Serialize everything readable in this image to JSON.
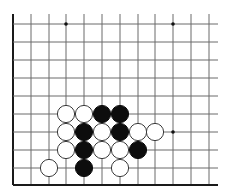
{
  "board": {
    "grid_color": "#6a6a6a",
    "edge_color": "#1a1a1a",
    "background": "#ffffff",
    "x_lines": [
      13,
      31,
      49,
      66,
      84,
      102,
      120,
      138,
      155,
      173,
      191,
      209
    ],
    "y_lines": [
      24,
      42,
      60,
      78,
      96,
      114,
      132,
      150,
      168,
      185
    ],
    "left_edge": true,
    "bottom_edge": true,
    "line_top_extend": 14,
    "line_right_extend": 218,
    "star_points": [
      {
        "col": 3,
        "row": 0
      },
      {
        "col": 9,
        "row": 0
      },
      {
        "col": 9,
        "row": 6
      }
    ],
    "stones": [
      {
        "color": "white",
        "col": 3,
        "row": 5
      },
      {
        "color": "white",
        "col": 4,
        "row": 5
      },
      {
        "color": "black",
        "col": 5,
        "row": 5
      },
      {
        "color": "black",
        "col": 6,
        "row": 5
      },
      {
        "color": "white",
        "col": 3,
        "row": 6
      },
      {
        "color": "black",
        "col": 4,
        "row": 6
      },
      {
        "color": "white",
        "col": 5,
        "row": 6
      },
      {
        "color": "black",
        "col": 6,
        "row": 6
      },
      {
        "color": "white",
        "col": 7,
        "row": 6
      },
      {
        "color": "white",
        "col": 8,
        "row": 6
      },
      {
        "color": "white",
        "col": 3,
        "row": 7
      },
      {
        "color": "black",
        "col": 4,
        "row": 7
      },
      {
        "color": "white",
        "col": 5,
        "row": 7
      },
      {
        "color": "white",
        "col": 6,
        "row": 7
      },
      {
        "color": "black",
        "col": 7,
        "row": 7
      },
      {
        "color": "white",
        "col": 2,
        "row": 8
      },
      {
        "color": "black",
        "col": 4,
        "row": 8
      },
      {
        "color": "white",
        "col": 6,
        "row": 8
      }
    ],
    "stone_radius": 8.6
  }
}
